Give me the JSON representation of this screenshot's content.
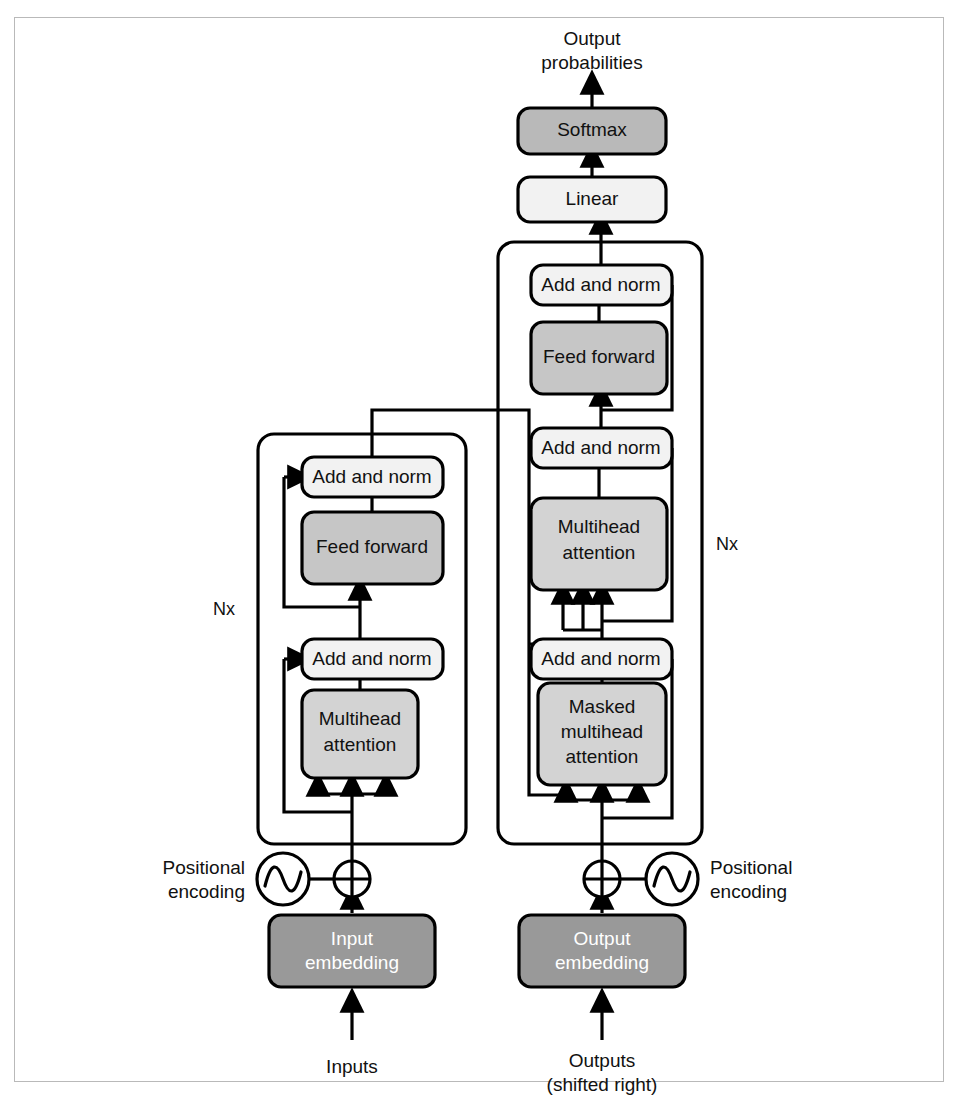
{
  "figure": {
    "repeat_label": "Nx"
  },
  "colors": {
    "block_light": "#f2f2f2",
    "block_mid": "#d3d3d3",
    "block_gray": "#c6c6c6",
    "block_softmax": "#b9b9b9",
    "block_dark": "#999999",
    "line": "#000000",
    "frame": "#b9b9b9",
    "page_bg": "#ffffff"
  },
  "top": {
    "output_probabilities_line1": "Output",
    "output_probabilities_line2": "probabilities",
    "softmax": "Softmax",
    "linear": "Linear"
  },
  "encoder": {
    "repeat": "Nx",
    "add_norm_upper": "Add and norm",
    "feed_forward": "Feed forward",
    "add_norm_lower": "Add and norm",
    "attention_line1": "Multihead",
    "attention_line2": "attention",
    "positional_encoding_line1": "Positional",
    "positional_encoding_line2": "encoding",
    "embedding_line1": "Input",
    "embedding_line2": "embedding",
    "input_label": "Inputs"
  },
  "decoder": {
    "repeat": "Nx",
    "add_norm_upper": "Add and norm",
    "feed_forward": "Feed forward",
    "add_norm_middle": "Add and norm",
    "cross_attention_line1": "Multihead",
    "cross_attention_line2": "attention",
    "add_norm_lower": "Add and norm",
    "masked_attention_line1": "Masked",
    "masked_attention_line2": "multihead",
    "masked_attention_line3": "attention",
    "positional_encoding_line1": "Positional",
    "positional_encoding_line2": "encoding",
    "embedding_line1": "Output",
    "embedding_line2": "embedding",
    "output_label_line1": "Outputs",
    "output_label_line2": "(shifted right)"
  }
}
